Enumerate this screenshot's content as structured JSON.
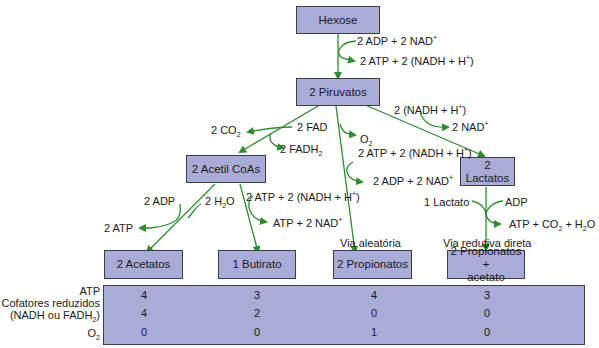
{
  "nodes": {
    "hexose": "Hexose",
    "piruvatos": "2 Piruvatos",
    "acetil_coas": "2 Acetil CoAs",
    "lactatos": "2 Lactatos",
    "acetatos": "2 Acetatos",
    "butirato": "1 Butirato",
    "propionatos": "2 Propionatos",
    "propionatos_acetato_line1": "2 Propionatos +",
    "propionatos_acetato_line2": "acetato"
  },
  "labels": {
    "hex_in": "2 ADP + 2 NAD",
    "hex_out": "2 ATP + 2 (NADH + H",
    "co2": "2 CO",
    "fad": "2 FAD",
    "fadh2": "2 FADH",
    "nadh_in": "2 (NADH + H",
    "nad_out": "2 NAD",
    "o2": "O",
    "prop_in": "2 ATP + 2 (NADH + H",
    "prop_out": "2 ADP + 2 NAD",
    "adp": "2 ADP",
    "h2o": "2 H",
    "atp": "2 ATP",
    "but_in": "2 ATP + 2 (NADH + H",
    "but_out": "ATP + 2 NAD",
    "lactato": "1 Lactato",
    "lac_adp": "ADP",
    "lac_out": "ATP + CO",
    "lac_out2": " + H",
    "via_aleatoria": "Via aleatória",
    "via_redutiva": "Via redutiva direta"
  },
  "table": {
    "row_labels": {
      "atp": "ATP",
      "cof1": "Cofatores reduzidos",
      "cof2": "(NADH ou FADH",
      "o2": "O"
    },
    "columns": [
      {
        "name": "2 Acetatos",
        "atp": "4",
        "cofatores": "4",
        "o2": "0"
      },
      {
        "name": "1 Butirato",
        "atp": "3",
        "cofatores": "2",
        "o2": "0"
      },
      {
        "name": "2 Propionatos",
        "atp": "4",
        "cofatores": "0",
        "o2": "1"
      },
      {
        "name": "2 Propionatos + acetato",
        "atp": "3",
        "cofatores": "0",
        "o2": "0"
      }
    ]
  },
  "colors": {
    "box_fill": "#a9acd6",
    "arrow_green": "#2e8b2e"
  }
}
